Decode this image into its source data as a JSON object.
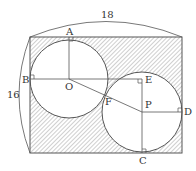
{
  "diagram": {
    "type": "geometry-figure",
    "dimensions": {
      "width_label": "18",
      "height_label": "16"
    },
    "points": {
      "A": "A",
      "B": "B",
      "C": "C",
      "D": "D",
      "E": "E",
      "F": "F",
      "O": "O",
      "P": "P"
    }
  },
  "colors": {
    "line": "#555555",
    "hatch": "#888888",
    "background": "#ffffff"
  }
}
